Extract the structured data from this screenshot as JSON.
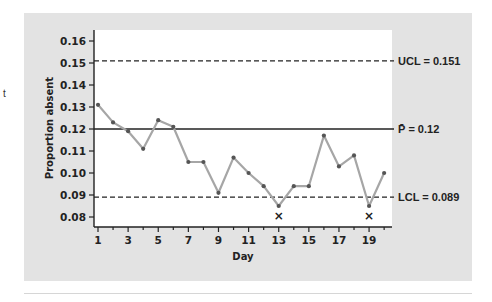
{
  "margin_text": "t",
  "chart_data": {
    "type": "line",
    "title": "",
    "xlabel": "Day",
    "ylabel": "Proportion absent",
    "x": [
      1,
      2,
      3,
      4,
      5,
      6,
      7,
      8,
      9,
      10,
      11,
      12,
      13,
      14,
      15,
      16,
      17,
      18,
      19,
      20
    ],
    "series": [
      {
        "name": "Proportion absent",
        "values": [
          0.131,
          0.123,
          0.119,
          0.111,
          0.124,
          0.121,
          0.105,
          0.105,
          0.091,
          0.107,
          0.1,
          0.094,
          0.085,
          0.094,
          0.094,
          0.117,
          0.103,
          0.108,
          0.085,
          0.1
        ]
      }
    ],
    "x_ticks": [
      "1",
      "3",
      "5",
      "7",
      "9",
      "11",
      "13",
      "15",
      "17",
      "19"
    ],
    "y_ticks": [
      "0.08",
      "0.09",
      "0.10",
      "0.11",
      "0.12",
      "0.13",
      "0.14",
      "0.15",
      "0.16"
    ],
    "ylim": [
      0.0755,
      0.1665
    ],
    "xlim": [
      0.7,
      20.5
    ],
    "grid": false,
    "reference_lines": [
      {
        "name": "UCL",
        "value": 0.151,
        "style": "dashed",
        "label": "UCL = 0.151"
      },
      {
        "name": "center",
        "value": 0.12,
        "style": "solid",
        "label": "P̄ = 0.12"
      },
      {
        "name": "LCL",
        "value": 0.089,
        "style": "dashed",
        "label": "LCL = 0.089"
      }
    ],
    "annotations": [
      {
        "day": 13,
        "text": "×",
        "note": "below LCL"
      },
      {
        "day": 19,
        "text": "×",
        "note": "below LCL"
      }
    ],
    "colors": {
      "line": "#a6a6a6",
      "point": "#555555",
      "panel": "#e3e3e3",
      "plot": "#ffffff"
    }
  }
}
